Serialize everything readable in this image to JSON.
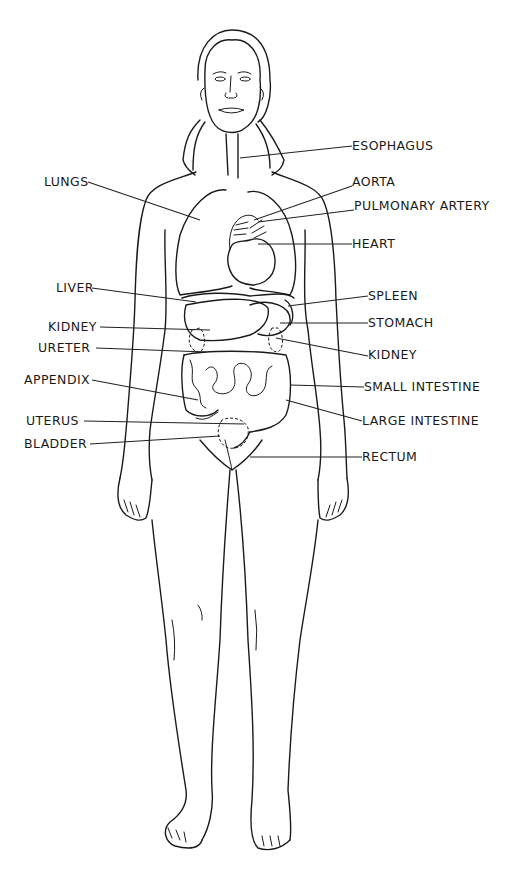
{
  "diagram": {
    "type": "anatomical-illustration",
    "line_color": "#1a1a1a",
    "background": "#ffffff",
    "labels_left": [
      {
        "id": "lungs",
        "text": "LUNGS"
      },
      {
        "id": "liver",
        "text": "LIVER"
      },
      {
        "id": "kidney-left",
        "text": "KIDNEY"
      },
      {
        "id": "ureter",
        "text": "URETER"
      },
      {
        "id": "appendix",
        "text": "APPENDIX"
      },
      {
        "id": "uterus",
        "text": "UTERUS"
      },
      {
        "id": "bladder",
        "text": "BLADDER"
      }
    ],
    "labels_right": [
      {
        "id": "esophagus",
        "text": "ESOPHAGUS"
      },
      {
        "id": "aorta",
        "text": "AORTA"
      },
      {
        "id": "pulmonary-artery",
        "text": "PULMONARY ARTERY"
      },
      {
        "id": "heart",
        "text": "HEART"
      },
      {
        "id": "spleen",
        "text": "SPLEEN"
      },
      {
        "id": "stomach",
        "text": "STOMACH"
      },
      {
        "id": "kidney-right",
        "text": "KIDNEY"
      },
      {
        "id": "small-intestine",
        "text": "SMALL INTESTINE"
      },
      {
        "id": "large-intestine",
        "text": "LARGE INTESTINE"
      },
      {
        "id": "rectum",
        "text": "RECTUM"
      }
    ]
  }
}
